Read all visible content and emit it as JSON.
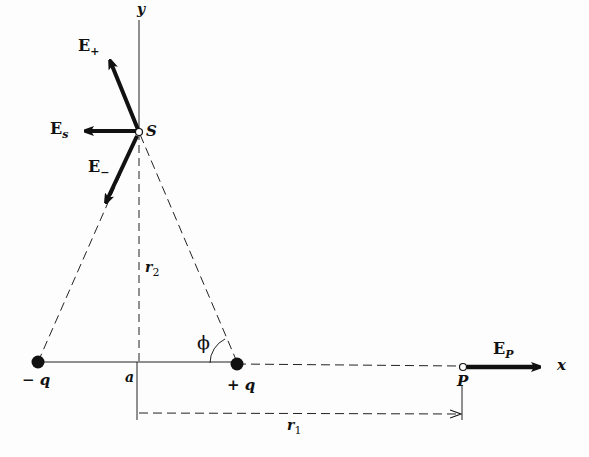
{
  "figure": {
    "axes": {
      "x_label": "x",
      "y_label": "y"
    },
    "charges": [
      {
        "id": "neg",
        "label": "− q",
        "x": 38,
        "y": 362
      },
      {
        "id": "pos",
        "label": "+ q",
        "x": 237,
        "y": 362
      }
    ],
    "points": [
      {
        "id": "S",
        "label": "S",
        "x": 139,
        "y": 132
      },
      {
        "id": "P",
        "label": "P",
        "x": 463,
        "y": 366
      }
    ],
    "origin_label": "a",
    "angle_label": "ϕ",
    "distances": {
      "r1": "r",
      "r1_sub": "1",
      "r2": "r",
      "r2_sub": "2"
    },
    "vectors": [
      {
        "id": "E_plus",
        "label": "E",
        "sub": "+"
      },
      {
        "id": "E_s",
        "label": "E",
        "sub": "s"
      },
      {
        "id": "E_minus",
        "label": "E",
        "sub": "−"
      },
      {
        "id": "E_P",
        "label": "E",
        "sub": "P"
      }
    ],
    "colors": {
      "ink": "#111111",
      "background": "#fdfdfd"
    }
  }
}
